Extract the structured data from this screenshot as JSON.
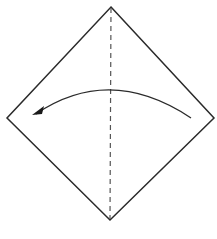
{
  "diagram": {
    "type": "origami-fold-step",
    "colors": {
      "outline": "#2a2a2a",
      "crease": "#555555",
      "arrow": "#2a2a2a",
      "background": "#ffffff"
    },
    "paper": {
      "shape": "diamond",
      "corners": {
        "top": [
          111,
          7
        ],
        "right": [
          214,
          118
        ],
        "bottom": [
          110,
          220
        ],
        "left": [
          7,
          118
        ]
      }
    },
    "crease": {
      "style": "valley-fold-dashed",
      "from": [
        111,
        7
      ],
      "to": [
        110,
        220
      ]
    },
    "arrow": {
      "direction": "right-to-left",
      "start": [
        191,
        118
      ],
      "control": [
        110,
        64
      ],
      "end": [
        36,
        114
      ]
    }
  }
}
